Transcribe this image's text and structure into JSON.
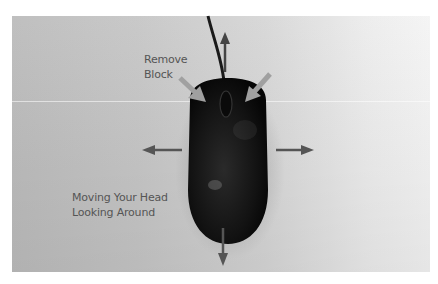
{
  "labels": {
    "remove_block": [
      "Remove",
      "Block"
    ],
    "moving_head": [
      "Moving Your Head",
      "Looking Around"
    ]
  },
  "arrows": [
    "up",
    "left",
    "right",
    "down",
    "remove-left-button",
    "remove-right-button"
  ],
  "colors": {
    "background": "#c8c8c8",
    "mouse": "#111111",
    "arrow": "#555555",
    "highlight_arrow": "#9a9a9a",
    "text": "#555555"
  }
}
